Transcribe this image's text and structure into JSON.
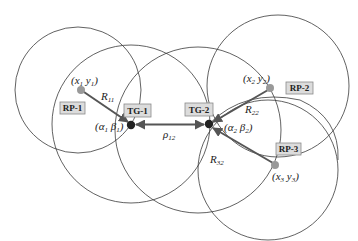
{
  "diagram": {
    "type": "localization-geometry",
    "colors": {
      "circle_stroke": "#3a3a3a",
      "reference_point_fill": "#999999",
      "target_fill": "#222222",
      "vector": "#555555",
      "label_box": "#dcdcdc"
    },
    "circles": [
      {
        "id": "c1",
        "cx": 78,
        "cy": 90,
        "r": 63
      },
      {
        "id": "c2",
        "cx": 131,
        "cy": 124,
        "r": 79
      },
      {
        "id": "c3",
        "cx": 198,
        "cy": 130,
        "r": 83
      },
      {
        "id": "c4",
        "cx": 278,
        "cy": 86,
        "r": 71
      },
      {
        "id": "c5",
        "cx": 268,
        "cy": 170,
        "r": 70
      },
      {
        "id": "c6",
        "cx": 276,
        "cy": 126,
        "r": 67
      }
    ],
    "reference_points": [
      {
        "id": "rp1",
        "label": "RP-1",
        "coord_label": "(x",
        "coord_sub1": "1",
        "coord_mid": "  y",
        "coord_sub2": "1",
        "coord_end": ")"
      },
      {
        "id": "rp2",
        "label": "RP-2",
        "coord_label": "(x",
        "coord_sub1": "2",
        "coord_mid": "  y",
        "coord_sub2": "2",
        "coord_end": ")"
      },
      {
        "id": "rp3",
        "label": "RP-3",
        "coord_label": "(x",
        "coord_sub1": "3",
        "coord_mid": "  y",
        "coord_sub2": "3",
        "coord_end": ")"
      }
    ],
    "targets": [
      {
        "id": "tg1",
        "label": "TG-1",
        "coord_label": "(α",
        "coord_sub1": "1",
        "coord_mid": "  β",
        "coord_sub2": "1",
        "coord_end": ")"
      },
      {
        "id": "tg2",
        "label": "TG-2",
        "coord_label": "(α",
        "coord_sub1": "2",
        "coord_mid": "  β",
        "coord_sub2": "2",
        "coord_end": ")"
      }
    ],
    "distances": [
      {
        "id": "r11",
        "symbol": "R",
        "sub": "11"
      },
      {
        "id": "r22",
        "symbol": "R",
        "sub": "22"
      },
      {
        "id": "r32",
        "symbol": "R",
        "sub": "32"
      },
      {
        "id": "rho12",
        "symbol": "ρ",
        "sub": "12"
      }
    ]
  }
}
